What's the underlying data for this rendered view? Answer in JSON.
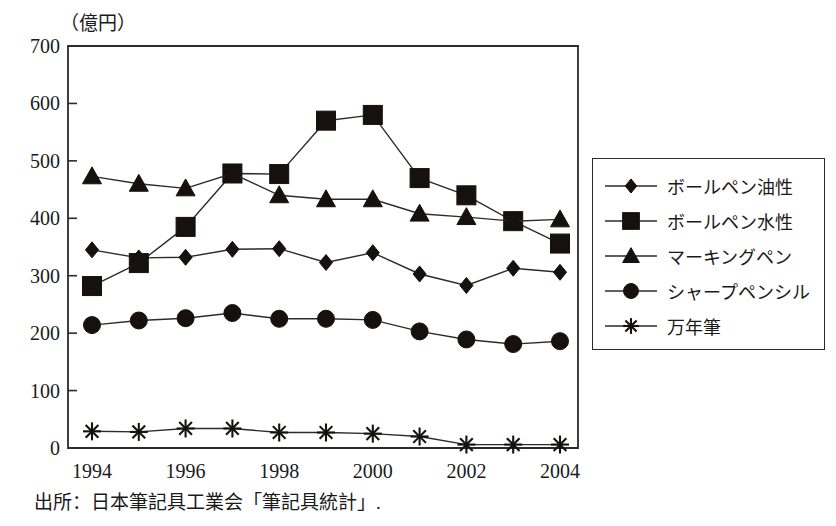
{
  "figure": {
    "unit_label": "（億円）",
    "source_note": "出所：日本筆記具工業会「筆記具統計」."
  },
  "chart_data": {
    "type": "line",
    "title": "",
    "subtitle": "",
    "xlabel": "",
    "ylabel": "（億円）",
    "unit": "億円",
    "grid": false,
    "legend_position": "right",
    "xlim": [
      1994,
      2004
    ],
    "ylim": [
      0,
      700
    ],
    "y_ticks": [
      0,
      100,
      200,
      300,
      400,
      500,
      600,
      700
    ],
    "y_tick_labels": [
      "0",
      "100",
      "200",
      "300",
      "400",
      "500",
      "600",
      "700"
    ],
    "x": [
      1994,
      1995,
      1996,
      1997,
      1998,
      1999,
      2000,
      2001,
      2002,
      2003,
      2004
    ],
    "x_tick_values": [
      1994,
      1996,
      1998,
      2000,
      2002,
      2004
    ],
    "x_tick_labels": [
      "1994",
      "1996",
      "1998",
      "2000",
      "2002",
      "2004"
    ],
    "series": [
      {
        "name": "ボールペン油性",
        "marker": "diamond",
        "values": [
          345,
          331,
          332,
          346,
          347,
          323,
          340,
          303,
          283,
          313,
          306
        ]
      },
      {
        "name": "ボールペン水性",
        "marker": "square",
        "values": [
          282,
          322,
          385,
          478,
          477,
          570,
          580,
          470,
          440,
          395,
          356
        ]
      },
      {
        "name": "マーキングペン",
        "marker": "triangle",
        "values": [
          473,
          460,
          452,
          478,
          440,
          433,
          433,
          408,
          402,
          395,
          398
        ]
      },
      {
        "name": "シャープペンシル",
        "marker": "circle",
        "values": [
          214,
          222,
          226,
          235,
          225,
          225,
          223,
          203,
          189,
          181,
          186
        ]
      },
      {
        "name": "万年筆",
        "marker": "star",
        "values": [
          29,
          28,
          34,
          34,
          27,
          27,
          25,
          20,
          6,
          6,
          6
        ]
      }
    ],
    "colors": {
      "line": "#2b2b2b",
      "marker": "#16110f",
      "background": "#ffffff"
    }
  },
  "legend": {
    "items": [
      {
        "label": "ボールペン油性",
        "marker": "diamond"
      },
      {
        "label": "ボールペン水性",
        "marker": "square"
      },
      {
        "label": "マーキングペン",
        "marker": "triangle"
      },
      {
        "label": "シャープペンシル",
        "marker": "circle"
      },
      {
        "label": "万年筆",
        "marker": "star"
      }
    ]
  }
}
